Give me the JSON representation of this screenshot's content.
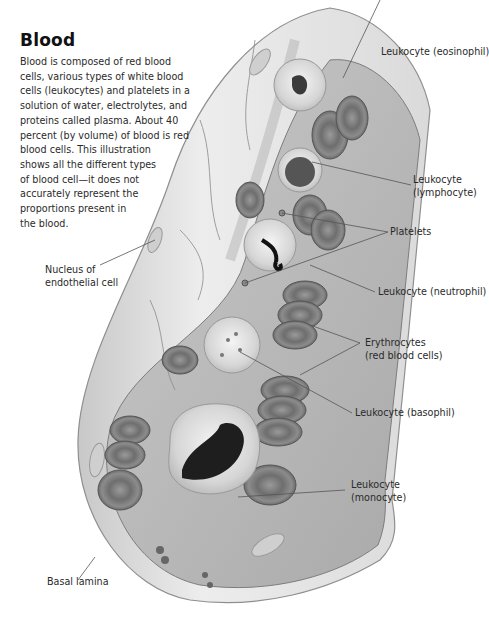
{
  "figure": {
    "title": "Blood",
    "intro_lines": [
      "Blood is composed of red blood",
      "cells, various types of white blood",
      "cells (leukocytes) and platelets in a",
      "solution of water, electrolytes, and",
      "proteins called plasma. About 40",
      "percent (by volume) of blood is red",
      "blood cells. This illustration",
      "shows all the different types",
      "of blood cell—it does not",
      "accurately represent the",
      "proportions present in",
      "the blood."
    ]
  },
  "labels": {
    "eosinophil": [
      "Leukocyte (eosinophil)"
    ],
    "lymphocyte": [
      "Leukocyte",
      "(lymphocyte)"
    ],
    "platelets": [
      "Platelets"
    ],
    "neutrophil": [
      "Leukocyte (neutrophil)"
    ],
    "erythrocytes": [
      "Erythrocytes",
      "(red blood cells)"
    ],
    "basophil": [
      "Leukocyte (basophil)"
    ],
    "monocyte": [
      "Leukocyte",
      "(monocyte)"
    ],
    "endothelial_nucleus": [
      "Nucleus of",
      "endothelial cell"
    ],
    "basal_lamina": [
      "Basal lamina"
    ]
  },
  "colors": {
    "text": "#2a2a2a",
    "vessel_wall": "#e4e4e4",
    "red_cell": "#7a7a7a",
    "nucleus_dark": "#1e1e1e",
    "leader_line": "#555555"
  }
}
